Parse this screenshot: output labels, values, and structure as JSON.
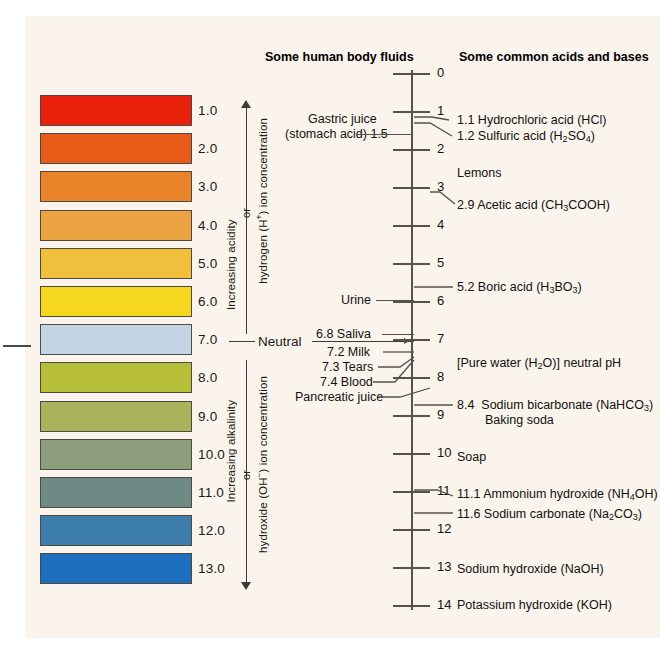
{
  "figure": {
    "type": "ph-scale-diagram",
    "background": "#faf4ec",
    "headings": {
      "body_fluids": "Some human body fluids",
      "acids_bases": "Some common acids and bases"
    },
    "neutral_label": "Neutral",
    "axis": {
      "min": 0,
      "max": 14,
      "ticks": [
        "0",
        "1",
        "2",
        "3",
        "4",
        "5",
        "6",
        "7",
        "8",
        "9",
        "10",
        "11",
        "12",
        "13",
        "14"
      ]
    },
    "bracket": {
      "upper_line1": "Increasing acidity",
      "upper_or": "or",
      "upper_line2": "hydrogen (H⁺) ion concentration",
      "lower_line1": "Increasing alkalinity",
      "lower_or": "or",
      "lower_line2": "hydroxide (OH⁻) ion concentration"
    }
  },
  "chart_data": {
    "type": "scatter",
    "xlabel": "",
    "ylabel": "pH",
    "ylim": [
      0,
      14
    ],
    "grid": false,
    "legend": "none",
    "swatches": [
      {
        "ph": "1.0",
        "value": 1,
        "color": "#e8200c"
      },
      {
        "ph": "2.0",
        "value": 2,
        "color": "#e85a18"
      },
      {
        "ph": "3.0",
        "value": 3,
        "color": "#e8832a"
      },
      {
        "ph": "4.0",
        "value": 4,
        "color": "#eca443"
      },
      {
        "ph": "5.0",
        "value": 5,
        "color": "#f0bf3c"
      },
      {
        "ph": "6.0",
        "value": 6,
        "color": "#f6d71f"
      },
      {
        "ph": "7.0",
        "value": 7,
        "color": "#c3d4e4"
      },
      {
        "ph": "8.0",
        "value": 8,
        "color": "#b6bd36"
      },
      {
        "ph": "9.0",
        "value": 9,
        "color": "#a8b35c"
      },
      {
        "ph": "10.0",
        "value": 10,
        "color": "#8d9e7d"
      },
      {
        "ph": "11.0",
        "value": 11,
        "color": "#6e8a85"
      },
      {
        "ph": "12.0",
        "value": 12,
        "color": "#3d7ead"
      },
      {
        "ph": "13.0",
        "value": 13,
        "color": "#1c70bd"
      }
    ],
    "body_fluids": [
      {
        "label": "Gastric juice",
        "value": 1.5,
        "line2": "(stomach acid) 1.5"
      },
      {
        "label": "Urine",
        "value": 6.0
      },
      {
        "label": "6.8 Saliva",
        "value": 6.8
      },
      {
        "label": "7.2 Milk",
        "value": 7.2
      },
      {
        "label": "7.3 Tears",
        "value": 7.3
      },
      {
        "label": "7.4 Blood",
        "value": 7.4
      },
      {
        "label": "Pancreatic juice",
        "value": 7.9
      }
    ],
    "acids_and_bases": [
      {
        "value": 1.1,
        "text": "1.1 Hydrochloric acid (HCl)"
      },
      {
        "value": 1.2,
        "text": "1.2 Sulfuric acid (H2SO4)"
      },
      {
        "value": 2.0,
        "text": "Lemons"
      },
      {
        "value": 2.9,
        "text": "2.9 Acetic acid (CH3COOH)"
      },
      {
        "value": 5.2,
        "text": "5.2 Boric acid (H3BO3)"
      },
      {
        "value": 7.0,
        "text": "[Pure water (H2O)] neutral pH"
      },
      {
        "value": 8.4,
        "text": "8.4  Sodium bicarbonate (NaHCO3)"
      },
      {
        "value": 8.4,
        "text": "Baking soda"
      },
      {
        "value": 10.0,
        "text": "Soap"
      },
      {
        "value": 11.1,
        "text": "11.1 Ammonium hydroxide (NH4OH)"
      },
      {
        "value": 11.6,
        "text": "11.6 Sodium carbonate (Na2CO3)"
      },
      {
        "value": 13.0,
        "text": "Sodium hydroxide (NaOH)"
      },
      {
        "value": 14.0,
        "text": "Potassium hydroxide (KOH)"
      }
    ]
  },
  "labels": {
    "gastric_line1": "Gastric juice",
    "gastric_line2": "(stomach acid) 1.5",
    "urine": "Urine",
    "saliva": "6.8 Saliva",
    "milk": "7.2 Milk",
    "tears": "7.3 Tears",
    "blood": "7.4 Blood",
    "pancreatic": "Pancreatic juice",
    "hcl": "1.1 Hydrochloric acid (HCl)",
    "lemons": "Lemons",
    "acetic": "2.9 Acetic acid (CH",
    "boric": "5.2 Boric acid (H",
    "purewater": "[Pure water (H",
    "bicarb": "8.4  Sodium bicarbonate (NaHCO",
    "bakingsoda": "Baking soda",
    "soap": "Soap",
    "ammonium": "11.1 Ammonium hydroxide (NH",
    "sodcarb": "11.6 Sodium carbonate (Na",
    "naoh": "Sodium hydroxide (NaOH)",
    "koh": "Potassium hydroxide (KOH)"
  }
}
